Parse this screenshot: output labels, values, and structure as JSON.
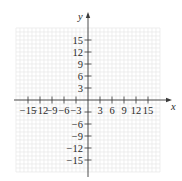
{
  "chart_data": {
    "type": "scatter",
    "title": "",
    "xlabel": "x",
    "ylabel": "y",
    "xlim": [
      -18,
      18
    ],
    "ylim": [
      -18,
      18
    ],
    "grid": true,
    "grid_step": 1,
    "x_ticks": [
      -15,
      -12,
      -9,
      -6,
      -3,
      3,
      6,
      9,
      12,
      15
    ],
    "x_tick_labels": [
      "−15",
      "−12",
      "−9",
      "−6",
      "−3",
      "3",
      "6",
      "9",
      "12",
      "15"
    ],
    "y_ticks": [
      15,
      12,
      9,
      6,
      3,
      -3,
      -6,
      -9,
      -12,
      -15
    ],
    "y_tick_labels": [
      "15",
      "12",
      "9",
      "6",
      "3",
      "",
      "−6",
      "−9",
      "−12",
      "−15"
    ],
    "series": [],
    "points": []
  },
  "layout": {
    "origin_px": [
      88,
      100
    ],
    "px_per_unit": 4,
    "x_axis_range_px": [
      14,
      172
    ],
    "y_axis_range_px": [
      12,
      177
    ],
    "colors": {
      "grid": "#e6e6e6",
      "axis": "#3a3a3a",
      "text": "#2a2a2a"
    }
  }
}
